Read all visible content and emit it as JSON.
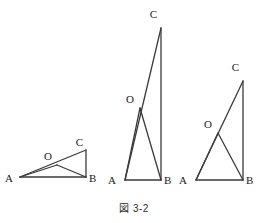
{
  "figure": {
    "caption": "図 3-2",
    "stroke_color": "#3a3a3a",
    "label_color": "#1a1a1a",
    "background_color": "#ffffff",
    "diagram_type": "geometry-triangles",
    "triangles": [
      {
        "name": "triangle-1",
        "labels": {
          "A": "A",
          "B": "B",
          "C": "C",
          "O": "O"
        },
        "points": {
          "A": [
            20,
            177
          ],
          "B": [
            86,
            177
          ],
          "C": [
            86,
            150
          ],
          "O": [
            57,
            165
          ]
        },
        "label_positions": {
          "A": [
            13,
            182
          ],
          "B": [
            89,
            182
          ],
          "C": [
            83,
            146
          ],
          "O": [
            48,
            160
          ]
        },
        "segments": [
          [
            "A",
            "B"
          ],
          [
            "B",
            "C"
          ],
          [
            "A",
            "C"
          ],
          [
            "A",
            "O"
          ],
          [
            "O",
            "B"
          ]
        ]
      },
      {
        "name": "triangle-2",
        "labels": {
          "A": "A",
          "B": "B",
          "C": "C",
          "O": "O"
        },
        "points": {
          "A": [
            125,
            180
          ],
          "B": [
            161,
            180
          ],
          "C": [
            161,
            28
          ],
          "O": [
            140,
            108
          ]
        },
        "label_positions": {
          "A": [
            116,
            184
          ],
          "B": [
            164,
            184
          ],
          "C": [
            157,
            18
          ],
          "O": [
            130,
            103
          ]
        },
        "segments": [
          [
            "A",
            "B"
          ],
          [
            "B",
            "C"
          ],
          [
            "A",
            "C"
          ],
          [
            "A",
            "O"
          ],
          [
            "O",
            "B"
          ]
        ]
      },
      {
        "name": "triangle-3",
        "labels": {
          "A": "A",
          "B": "B",
          "C": "C",
          "O": "O"
        },
        "points": {
          "A": [
            196,
            180
          ],
          "B": [
            243,
            180
          ],
          "C": [
            243,
            81
          ],
          "O": [
            218,
            133
          ]
        },
        "label_positions": {
          "A": [
            187,
            184
          ],
          "B": [
            246,
            184
          ],
          "C": [
            239,
            71
          ],
          "O": [
            208,
            128
          ]
        },
        "segments": [
          [
            "A",
            "B"
          ],
          [
            "B",
            "C"
          ],
          [
            "A",
            "C"
          ],
          [
            "A",
            "O"
          ],
          [
            "O",
            "B"
          ]
        ]
      }
    ]
  }
}
